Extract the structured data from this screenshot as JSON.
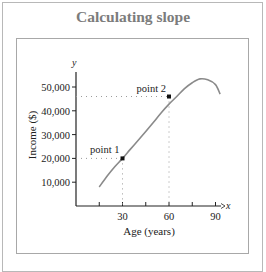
{
  "chart_data": {
    "type": "line",
    "title": "Calculating slope",
    "xlabel": "Age (years)",
    "ylabel": "Income ($)",
    "x_axis_letter": "x",
    "y_axis_letter": "y",
    "x_ticks": [
      15,
      30,
      45,
      60,
      75,
      90
    ],
    "x_tick_labels": [
      "",
      "30",
      "",
      "60",
      "",
      "90"
    ],
    "y_ticks": [
      10000,
      20000,
      30000,
      40000,
      50000
    ],
    "y_tick_labels": [
      "10,000",
      "20,000",
      "30,000",
      "40,000",
      "50,000"
    ],
    "xlim": [
      0,
      95
    ],
    "ylim": [
      0,
      56000
    ],
    "grid": false,
    "series": [
      {
        "name": "income curve",
        "x": [
          15,
          20,
          25,
          30,
          35,
          40,
          45,
          50,
          55,
          60,
          65,
          70,
          75,
          80,
          85,
          90,
          93
        ],
        "y": [
          8000,
          12500,
          16500,
          20000,
          23800,
          27500,
          31300,
          35200,
          39200,
          42800,
          46000,
          49300,
          51800,
          53400,
          53000,
          51000,
          47000
        ]
      }
    ],
    "annotations": [
      {
        "label": "point 1",
        "x": 30,
        "y": 20000
      },
      {
        "label": "point 2",
        "x": 60,
        "y": 46000
      }
    ]
  },
  "colors": {
    "title": "#7c7c7c",
    "curve": "#8a8a8a",
    "axis": "#222222",
    "dotted": "#9a9a9a",
    "border": "#b0b0b0"
  }
}
